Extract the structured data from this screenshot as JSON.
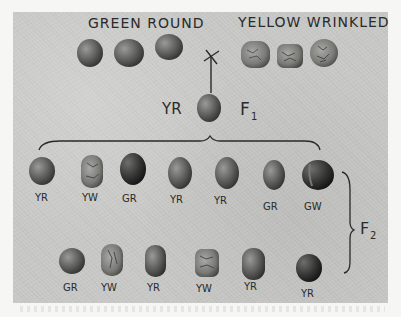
{
  "figure": {
    "parents": {
      "left_label": "GREEN ROUND",
      "right_label": "YELLOW WRINKLED",
      "cross_symbol": "X"
    },
    "f1": {
      "genotype_label": "YR",
      "generation_label": "F",
      "generation_sub": "1"
    },
    "f2": {
      "generation_label": "F",
      "generation_sub": "2",
      "row1": [
        {
          "label": "YR"
        },
        {
          "label": "YW"
        },
        {
          "label": "GR"
        },
        {
          "label": "YR"
        },
        {
          "label": "YR"
        },
        {
          "label": "GR"
        },
        {
          "label": "GW"
        }
      ],
      "row2": [
        {
          "label": "GR"
        },
        {
          "label": "YW"
        },
        {
          "label": "YR"
        },
        {
          "label": "YW"
        },
        {
          "label": "YR"
        },
        {
          "label": "YR"
        }
      ]
    }
  },
  "colors": {
    "background": "#c9c9c7",
    "ink": "#2a2a2a",
    "pea_dark": "#3a3a3a",
    "pea_light": "#8a8a8a"
  }
}
